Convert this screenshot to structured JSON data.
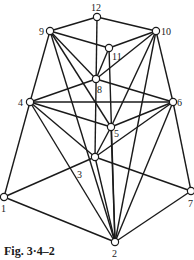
{
  "figure": {
    "caption": "Fig. 3·4–2",
    "nodes": [
      {
        "id": "1",
        "x": 4,
        "y": 197,
        "lx": 1,
        "ly": 212
      },
      {
        "id": "2",
        "x": 115,
        "y": 242,
        "lx": 112,
        "ly": 257
      },
      {
        "id": "3",
        "x": 95,
        "y": 157,
        "lx": 77,
        "ly": 178
      },
      {
        "id": "4",
        "x": 30,
        "y": 102,
        "lx": 18,
        "ly": 106
      },
      {
        "id": "5",
        "x": 111,
        "y": 127,
        "lx": 114,
        "ly": 137
      },
      {
        "id": "6",
        "x": 173,
        "y": 102,
        "lx": 177,
        "ly": 106
      },
      {
        "id": "7",
        "x": 191,
        "y": 191,
        "lx": 188,
        "ly": 207
      },
      {
        "id": "8",
        "x": 96,
        "y": 79,
        "lx": 97,
        "ly": 93
      },
      {
        "id": "9",
        "x": 50,
        "y": 31,
        "lx": 39,
        "ly": 35
      },
      {
        "id": "10",
        "x": 156,
        "y": 31,
        "lx": 161,
        "ly": 35
      },
      {
        "id": "11",
        "x": 109,
        "y": 48,
        "lx": 112,
        "ly": 60
      },
      {
        "id": "12",
        "x": 97,
        "y": 17,
        "lx": 91,
        "ly": 11
      }
    ],
    "edges": [
      [
        "12",
        "9"
      ],
      [
        "12",
        "10"
      ],
      [
        "12",
        "3"
      ],
      [
        "9",
        "11"
      ],
      [
        "11",
        "10"
      ],
      [
        "9",
        "4"
      ],
      [
        "9",
        "8"
      ],
      [
        "9",
        "5"
      ],
      [
        "9",
        "2"
      ],
      [
        "10",
        "6"
      ],
      [
        "10",
        "8"
      ],
      [
        "10",
        "5"
      ],
      [
        "10",
        "2"
      ],
      [
        "11",
        "8"
      ],
      [
        "11",
        "2"
      ],
      [
        "8",
        "4"
      ],
      [
        "8",
        "6"
      ],
      [
        "4",
        "5"
      ],
      [
        "4",
        "6"
      ],
      [
        "4",
        "1"
      ],
      [
        "4",
        "3"
      ],
      [
        "4",
        "2"
      ],
      [
        "6",
        "5"
      ],
      [
        "6",
        "3"
      ],
      [
        "6",
        "7"
      ],
      [
        "6",
        "2"
      ],
      [
        "5",
        "3"
      ],
      [
        "5",
        "2"
      ],
      [
        "3",
        "1"
      ],
      [
        "3",
        "7"
      ],
      [
        "3",
        "2"
      ],
      [
        "1",
        "2"
      ],
      [
        "7",
        "2"
      ]
    ]
  }
}
